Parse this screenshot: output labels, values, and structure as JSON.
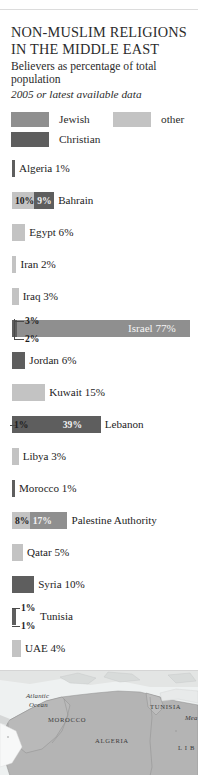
{
  "header": {
    "title": "NON-MUSLIM RELIGIONS IN THE MIDDLE EAST",
    "subtitle": "Believers as percentage of total population",
    "dateline": "2005 or latest available data"
  },
  "legend": {
    "jewish": "Jewish",
    "other": "other",
    "christian": "Christian",
    "colors": {
      "jewish": "#8f8f8f",
      "other": "#c3c3c3",
      "christian": "#5e5e5e"
    }
  },
  "chart_data": {
    "type": "bar",
    "title": "NON-MUSLIM RELIGIONS IN THE MIDDLE EAST",
    "ylabel": "",
    "xlabel": "percentage of total population",
    "note": "Stacked horizontal bars; series are Jewish, Christian and other believers",
    "series": [
      "Jewish",
      "Christian",
      "other"
    ],
    "categories": [
      "Algeria",
      "Bahrain",
      "Egypt",
      "Iran",
      "Iraq",
      "Israel",
      "Jordan",
      "Kuwait",
      "Lebanon",
      "Libya",
      "Morocco",
      "Palestine Authority",
      "Qatar",
      "Syria",
      "Tunisia",
      "UAE"
    ],
    "rows": [
      {
        "name": "Algeria",
        "label": "Algeria 1%",
        "label_pos": "outside",
        "total": 1,
        "segments": [
          {
            "series": "christian",
            "value": 1,
            "label": "",
            "show": false
          }
        ]
      },
      {
        "name": "Bahrain",
        "label": "Bahrain",
        "label_pos": "outside",
        "total": 19,
        "segments": [
          {
            "series": "other",
            "value": 10,
            "label": "10%",
            "show": true
          },
          {
            "series": "christian",
            "value": 9,
            "label": "9%",
            "show": true
          }
        ]
      },
      {
        "name": "Egypt",
        "label": "Egypt 6%",
        "label_pos": "outside",
        "total": 6,
        "segments": [
          {
            "series": "other",
            "value": 6,
            "label": "",
            "show": false
          }
        ]
      },
      {
        "name": "Iran",
        "label": "Iran 2%",
        "label_pos": "outside",
        "total": 2,
        "segments": [
          {
            "series": "other",
            "value": 2,
            "label": "",
            "show": false
          }
        ]
      },
      {
        "name": "Iraq",
        "label": "Iraq 3%",
        "label_pos": "outside",
        "total": 3,
        "segments": [
          {
            "series": "other",
            "value": 3,
            "label": "",
            "show": false
          }
        ]
      },
      {
        "name": "Israel",
        "label": "Israel 77%",
        "label_pos": "inside",
        "total": 82,
        "callouts": [
          {
            "text": "3%",
            "value": 3
          },
          {
            "text": "2%",
            "value": 2
          }
        ],
        "segments": [
          {
            "series": "christian",
            "value": 3,
            "label": "3%",
            "show": false
          },
          {
            "series": "jewish",
            "value": 77,
            "label": "77%",
            "show": false
          }
        ]
      },
      {
        "name": "Jordan",
        "label": "Jordan 6%",
        "label_pos": "outside",
        "total": 6,
        "segments": [
          {
            "series": "christian",
            "value": 6,
            "label": "",
            "show": false
          }
        ]
      },
      {
        "name": "Kuwait",
        "label": "Kuwait 15%",
        "label_pos": "outside",
        "total": 15,
        "segments": [
          {
            "series": "other",
            "value": 15,
            "label": "",
            "show": false
          }
        ]
      },
      {
        "name": "Lebanon",
        "label": "Lebanon",
        "label_pos": "outside",
        "total": 40,
        "callouts": [
          {
            "text": "1%",
            "value": 1
          }
        ],
        "segments": [
          {
            "series": "christian",
            "value": 39,
            "label": "39%",
            "show": true
          }
        ]
      },
      {
        "name": "Libya",
        "label": "Libya 3%",
        "label_pos": "outside",
        "total": 3,
        "segments": [
          {
            "series": "other",
            "value": 3,
            "label": "",
            "show": false
          }
        ]
      },
      {
        "name": "Morocco",
        "label": "Morocco 1%",
        "label_pos": "outside",
        "total": 1,
        "segments": [
          {
            "series": "christian",
            "value": 1,
            "label": "",
            "show": false
          }
        ]
      },
      {
        "name": "Palestine Authority",
        "label": "Palestine Authority",
        "label_pos": "outside",
        "total": 25,
        "segments": [
          {
            "series": "other",
            "value": 8,
            "label": "8%",
            "show": true
          },
          {
            "series": "jewish",
            "value": 17,
            "label": "17%",
            "show": true
          }
        ]
      },
      {
        "name": "Qatar",
        "label": "Qatar 5%",
        "label_pos": "outside",
        "total": 5,
        "segments": [
          {
            "series": "other",
            "value": 5,
            "label": "",
            "show": false
          }
        ]
      },
      {
        "name": "Syria",
        "label": "Syria 10%",
        "label_pos": "outside",
        "total": 10,
        "segments": [
          {
            "series": "christian",
            "value": 10,
            "label": "",
            "show": false
          }
        ]
      },
      {
        "name": "Tunisia",
        "label": "Tunisia",
        "label_pos": "outside",
        "total": 2,
        "callouts": [
          {
            "text": "1%",
            "value": 1
          },
          {
            "text": "1%",
            "value": 1
          }
        ],
        "segments": [
          {
            "series": "christian",
            "value": 2,
            "label": "",
            "show": false
          }
        ]
      },
      {
        "name": "UAE",
        "label": "UAE 4%",
        "label_pos": "outside",
        "total": 4,
        "segments": [
          {
            "series": "other",
            "value": 4,
            "label": "",
            "show": false
          }
        ]
      }
    ]
  },
  "map": {
    "labels": [
      {
        "text": "Atlantic",
        "x": 26,
        "y": 22,
        "italic": true
      },
      {
        "text": "Ocean",
        "x": 29,
        "y": 31,
        "italic": true
      },
      {
        "text": "MOROCCO",
        "x": 48,
        "y": 46,
        "italic": false
      },
      {
        "text": "ALGERIA",
        "x": 95,
        "y": 67,
        "italic": false
      },
      {
        "text": "TUNISIA",
        "x": 150,
        "y": 33,
        "italic": false
      },
      {
        "text": "Mea",
        "x": 185,
        "y": 44,
        "italic": true
      },
      {
        "text": "L I B",
        "x": 178,
        "y": 74,
        "italic": false
      }
    ]
  }
}
